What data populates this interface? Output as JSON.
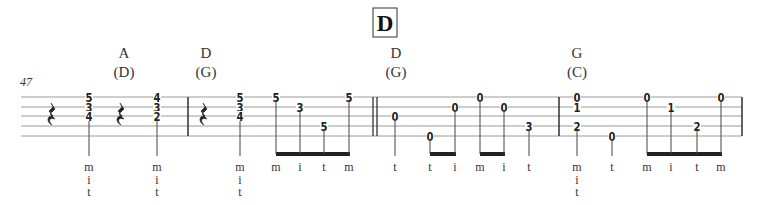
{
  "section": {
    "label": "D"
  },
  "measure_number": "47",
  "staff": {
    "left": 21,
    "right": 742,
    "lines_y": [
      97,
      107,
      116,
      126,
      136
    ],
    "line_color": "#9a9a9a",
    "ink": "#222222"
  },
  "barlines": [
    {
      "x": 188,
      "type": "single"
    },
    {
      "x": 373,
      "type": "double"
    },
    {
      "x": 559,
      "type": "single"
    },
    {
      "x": 742,
      "type": "single"
    }
  ],
  "chord_names": [
    {
      "x": 124,
      "chord": "A",
      "capo": "(D)"
    },
    {
      "x": 206,
      "chord": "D",
      "capo": "(G)"
    },
    {
      "x": 396,
      "chord": "D",
      "capo": "(G)"
    },
    {
      "x": 577,
      "chord": "G",
      "capo": "(C)"
    }
  ],
  "rests": [
    {
      "x": 52,
      "type": "quarter-rest"
    },
    {
      "x": 121,
      "type": "quarter-rest"
    },
    {
      "x": 204,
      "type": "quarter-rest"
    }
  ],
  "notes": [
    {
      "x": 89,
      "frets": [
        {
          "string": 1,
          "fret": "5"
        },
        {
          "string": 2,
          "fret": "3"
        },
        {
          "string": 3,
          "fret": "4"
        }
      ],
      "fingers": [
        "m",
        "i",
        "t"
      ],
      "stem_end": 156
    },
    {
      "x": 157,
      "frets": [
        {
          "string": 1,
          "fret": "4"
        },
        {
          "string": 2,
          "fret": "3"
        },
        {
          "string": 3,
          "fret": "2"
        }
      ],
      "fingers": [
        "m",
        "i",
        "t"
      ],
      "stem_end": 156
    },
    {
      "x": 240,
      "frets": [
        {
          "string": 1,
          "fret": "5"
        },
        {
          "string": 2,
          "fret": "3"
        },
        {
          "string": 3,
          "fret": "4"
        }
      ],
      "fingers": [
        "m",
        "i",
        "t"
      ],
      "stem_end": 156
    },
    {
      "x": 276,
      "frets": [
        {
          "string": 1,
          "fret": "5"
        }
      ],
      "fingers": [
        "m"
      ],
      "beam": 1
    },
    {
      "x": 300,
      "frets": [
        {
          "string": 2,
          "fret": "3"
        }
      ],
      "fingers": [
        "i"
      ],
      "beam": 1
    },
    {
      "x": 324,
      "frets": [
        {
          "string": 4,
          "fret": "5"
        }
      ],
      "fingers": [
        "t"
      ],
      "beam": 1
    },
    {
      "x": 349,
      "frets": [
        {
          "string": 1,
          "fret": "5"
        }
      ],
      "fingers": [
        "m"
      ],
      "beam": 1
    },
    {
      "x": 395,
      "frets": [
        {
          "string": 3,
          "fret": "0"
        }
      ],
      "fingers": [
        "t"
      ],
      "stem_end": 156
    },
    {
      "x": 430,
      "frets": [
        {
          "string": 5,
          "fret": "0"
        }
      ],
      "fingers": [
        "t"
      ],
      "beam": 2
    },
    {
      "x": 455,
      "frets": [
        {
          "string": 2,
          "fret": "0"
        }
      ],
      "fingers": [
        "i"
      ],
      "beam": 2
    },
    {
      "x": 480,
      "frets": [
        {
          "string": 1,
          "fret": "0"
        }
      ],
      "fingers": [
        "m"
      ],
      "beam": 3
    },
    {
      "x": 504,
      "frets": [
        {
          "string": 2,
          "fret": "0"
        }
      ],
      "fingers": [
        "i"
      ],
      "beam": 3
    },
    {
      "x": 529,
      "frets": [
        {
          "string": 4,
          "fret": "3"
        }
      ],
      "fingers": [
        "t"
      ],
      "stem_end": 156
    },
    {
      "x": 577,
      "frets": [
        {
          "string": 1,
          "fret": "0"
        },
        {
          "string": 2,
          "fret": "1"
        },
        {
          "string": 4,
          "fret": "2"
        }
      ],
      "fingers": [
        "m",
        "i",
        "t"
      ],
      "stem_end": 156
    },
    {
      "x": 612,
      "frets": [
        {
          "string": 5,
          "fret": "0"
        }
      ],
      "fingers": [
        "t"
      ],
      "stem_end": 156
    },
    {
      "x": 647,
      "frets": [
        {
          "string": 1,
          "fret": "0"
        }
      ],
      "fingers": [
        "m"
      ],
      "beam": 4
    },
    {
      "x": 671,
      "frets": [
        {
          "string": 2,
          "fret": "1"
        }
      ],
      "fingers": [
        "i"
      ],
      "beam": 4
    },
    {
      "x": 697,
      "frets": [
        {
          "string": 4,
          "fret": "2"
        }
      ],
      "fingers": [
        "t"
      ],
      "beam": 4
    },
    {
      "x": 721,
      "frets": [
        {
          "string": 1,
          "fret": "0"
        }
      ],
      "fingers": [
        "m"
      ],
      "beam": 4
    }
  ],
  "beam_y": 154,
  "finger_rows_y": [
    167,
    180,
    192
  ]
}
